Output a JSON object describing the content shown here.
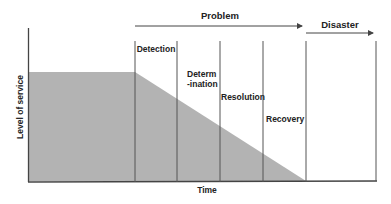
{
  "diagram": {
    "y_axis_label": "Level of service",
    "x_axis_label": "Time",
    "phases": [
      {
        "label_lines": [
          "Detection"
        ]
      },
      {
        "label_lines": [
          "Determ",
          "-ination"
        ]
      },
      {
        "label_lines": [
          "Resolution"
        ]
      },
      {
        "label_lines": [
          "Recovery"
        ]
      }
    ],
    "arrows": {
      "problem": "Problem",
      "disaster": "Disaster"
    },
    "colors": {
      "fill": "#b3b3b3",
      "line": "#444444",
      "text": "#222222"
    }
  }
}
